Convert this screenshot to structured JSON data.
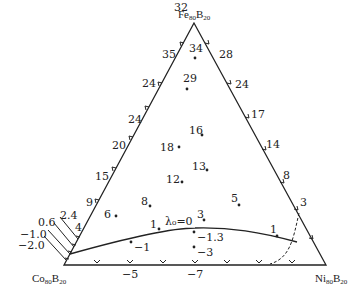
{
  "vertices": {
    "top": {
      "base": "Fe",
      "sub1": "80",
      "b": "B",
      "sub2": "20"
    },
    "left": {
      "base": "Co",
      "sub1": "80",
      "b": "B",
      "sub2": "20"
    },
    "right": {
      "base": "Ni",
      "sub1": "80",
      "b": "B",
      "sub2": "20"
    }
  },
  "left_edge_labels": [
    "32",
    "35",
    "24",
    "24",
    "20",
    "15",
    "9",
    "4",
    "2.4",
    "0.6",
    "−1.0",
    "−2.0"
  ],
  "right_edge_labels": [
    "28",
    "24",
    "17",
    "14",
    "8",
    "3"
  ],
  "bottom_edge_labels": [
    "−5",
    "−7"
  ],
  "interior_points": [
    {
      "label": "34"
    },
    {
      "label": "29"
    },
    {
      "label": "16"
    },
    {
      "label": "18"
    },
    {
      "label": "13"
    },
    {
      "label": "12"
    },
    {
      "label": "8"
    },
    {
      "label": "5"
    },
    {
      "label": "6"
    },
    {
      "label": "3"
    },
    {
      "label": "1"
    },
    {
      "label": "−1.3"
    },
    {
      "label": "−1"
    },
    {
      "label": "−3"
    },
    {
      "label": "1"
    }
  ],
  "curve_label": "λ₀=0",
  "colors": {
    "line": "#222222",
    "text": "#222222",
    "background": "#ffffff"
  }
}
